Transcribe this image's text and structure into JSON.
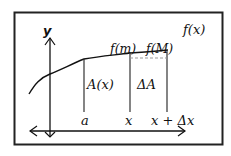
{
  "diagram": {
    "y_axis_label": "y",
    "function_label": "f(x)",
    "min_label": "f(m)",
    "max_label": "f(M)",
    "area_label": "A(x)",
    "delta_area_label": "ΔA",
    "x_ticks": [
      "a",
      "x",
      "x + Δx"
    ],
    "colors": {
      "stroke": "#111111",
      "dashed": "#999999",
      "background": "#ffffff"
    }
  }
}
